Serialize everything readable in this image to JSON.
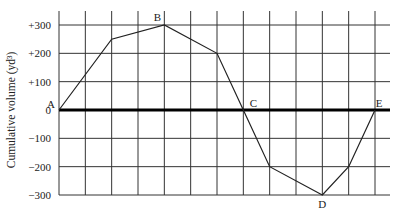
{
  "chart_data": {
    "type": "line",
    "title": "",
    "xlabel": "",
    "ylabel": "Cumulative volume (yd³)",
    "ylim": [
      -300,
      300
    ],
    "y_ticks": [
      300,
      200,
      100,
      0,
      -100,
      -200,
      -300
    ],
    "y_tick_labels": [
      "+300",
      "+200",
      "+100",
      "0",
      "−100",
      "−200",
      "−300"
    ],
    "x_grid_count": 13,
    "xlim": [
      0,
      12
    ],
    "grid": true,
    "series": [
      {
        "name": "Mass diagram",
        "x": [
          0,
          2,
          4,
          6,
          7,
          8,
          10,
          11,
          12
        ],
        "y": [
          0,
          250,
          300,
          200,
          0,
          -200,
          -300,
          -200,
          0
        ]
      }
    ],
    "annotations": [
      {
        "label": "A",
        "x": 0,
        "y": 0
      },
      {
        "label": "B",
        "x": 4,
        "y": 300
      },
      {
        "label": "C",
        "x": 7,
        "y": 0
      },
      {
        "label": "D",
        "x": 10,
        "y": -300
      },
      {
        "label": "E",
        "x": 12,
        "y": 0
      }
    ]
  }
}
